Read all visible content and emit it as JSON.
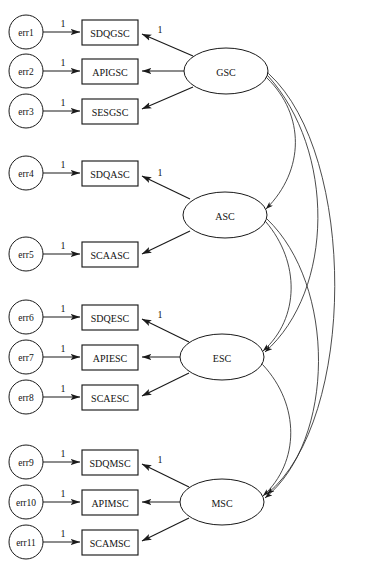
{
  "figure": {
    "type": "sem-path-diagram",
    "title_fragment": "",
    "width": 370,
    "height": 569,
    "background": "#ffffff",
    "stroke_color": "#1a1a1a",
    "arc_color": "#2b2b2b",
    "text_color": "#121212"
  },
  "errors": [
    {
      "id": "err1",
      "label": "err1",
      "cx": 26,
      "cy": 32,
      "r": 17
    },
    {
      "id": "err2",
      "label": "err2",
      "cx": 26,
      "cy": 71,
      "r": 17
    },
    {
      "id": "err3",
      "label": "err3",
      "cx": 26,
      "cy": 111,
      "r": 17
    },
    {
      "id": "err4",
      "label": "err4",
      "cx": 26,
      "cy": 173,
      "r": 17
    },
    {
      "id": "err5",
      "label": "err5",
      "cx": 26,
      "cy": 254,
      "r": 17
    },
    {
      "id": "err6",
      "label": "err6",
      "cx": 26,
      "cy": 317,
      "r": 17
    },
    {
      "id": "err7",
      "label": "err7",
      "cx": 26,
      "cy": 357,
      "r": 17
    },
    {
      "id": "err8",
      "label": "err8",
      "cx": 26,
      "cy": 397,
      "r": 17
    },
    {
      "id": "err9",
      "label": "err9",
      "cx": 26,
      "cy": 462,
      "r": 17
    },
    {
      "id": "err10",
      "label": "err10",
      "cx": 26,
      "cy": 502,
      "r": 17
    },
    {
      "id": "err11",
      "label": "err11",
      "cx": 26,
      "cy": 542,
      "r": 17
    }
  ],
  "observed": [
    {
      "id": "SDQGSC",
      "label": "SDQGSC",
      "x": 82,
      "y": 20,
      "w": 56,
      "h": 25
    },
    {
      "id": "APIGSC",
      "label": "APIGSC",
      "x": 82,
      "y": 59,
      "w": 56,
      "h": 25
    },
    {
      "id": "SESGSC",
      "label": "SESGSC",
      "x": 82,
      "y": 99,
      "w": 56,
      "h": 25
    },
    {
      "id": "SDQASC",
      "label": "SDQASC",
      "x": 82,
      "y": 161,
      "w": 56,
      "h": 25
    },
    {
      "id": "SCAASC",
      "label": "SCAASC",
      "x": 82,
      "y": 242,
      "w": 56,
      "h": 25
    },
    {
      "id": "SDQESC",
      "label": "SDQESC",
      "x": 82,
      "y": 305,
      "w": 56,
      "h": 25
    },
    {
      "id": "APIESC",
      "label": "APIESC",
      "x": 82,
      "y": 345,
      "w": 56,
      "h": 25
    },
    {
      "id": "SCAESC",
      "label": "SCAESC",
      "x": 82,
      "y": 385,
      "w": 56,
      "h": 25
    },
    {
      "id": "SDQMSC",
      "label": "SDQMSC",
      "x": 82,
      "y": 450,
      "w": 56,
      "h": 25
    },
    {
      "id": "APIMSC",
      "label": "APIMSC",
      "x": 82,
      "y": 490,
      "w": 56,
      "h": 25
    },
    {
      "id": "SCAMSC",
      "label": "SCAMSC",
      "x": 82,
      "y": 530,
      "w": 56,
      "h": 25
    }
  ],
  "latents": [
    {
      "id": "GSC",
      "label": "GSC",
      "cx": 226,
      "cy": 71,
      "rx": 42,
      "ry": 23
    },
    {
      "id": "ASC",
      "label": "ASC",
      "cx": 225,
      "cy": 215,
      "rx": 42,
      "ry": 23
    },
    {
      "id": "ESC",
      "label": "ESC",
      "cx": 222,
      "cy": 357,
      "rx": 42,
      "ry": 23
    },
    {
      "id": "MSC",
      "label": "MSC",
      "cx": 222,
      "cy": 502,
      "rx": 42,
      "ry": 23
    }
  ],
  "error_paths": [
    {
      "from": "err1",
      "to": "SDQGSC",
      "weight": "1",
      "label_x": 63,
      "label_y": 23
    },
    {
      "from": "err2",
      "to": "APIGSC",
      "weight": "1",
      "label_x": 63,
      "label_y": 62
    },
    {
      "from": "err3",
      "to": "SESGSC",
      "weight": "1",
      "label_x": 63,
      "label_y": 102
    },
    {
      "from": "err4",
      "to": "SDQASC",
      "weight": "1",
      "label_x": 63,
      "label_y": 164
    },
    {
      "from": "err5",
      "to": "SCAASC",
      "weight": "1",
      "label_x": 63,
      "label_y": 245
    },
    {
      "from": "err6",
      "to": "SDQESC",
      "weight": "1",
      "label_x": 63,
      "label_y": 308
    },
    {
      "from": "err7",
      "to": "APIESC",
      "weight": "1",
      "label_x": 63,
      "label_y": 348
    },
    {
      "from": "err8",
      "to": "SCAESC",
      "weight": "1",
      "label_x": 63,
      "label_y": 388
    },
    {
      "from": "err9",
      "to": "SDQMSC",
      "weight": "1",
      "label_x": 63,
      "label_y": 453
    },
    {
      "from": "err10",
      "to": "APIMSC",
      "weight": "1",
      "label_x": 63,
      "label_y": 493
    },
    {
      "from": "err11",
      "to": "SCAMSC",
      "weight": "1",
      "label_x": 63,
      "label_y": 533
    }
  ],
  "loading_paths": [
    {
      "from": "GSC",
      "to": "SDQGSC",
      "weight": "1",
      "label_x": 160,
      "label_y": 29
    },
    {
      "from": "GSC",
      "to": "APIGSC",
      "weight": "",
      "label_x": 0,
      "label_y": 0
    },
    {
      "from": "GSC",
      "to": "SESGSC",
      "weight": "",
      "label_x": 0,
      "label_y": 0
    },
    {
      "from": "ASC",
      "to": "SDQASC",
      "weight": "1",
      "label_x": 160,
      "label_y": 172
    },
    {
      "from": "ASC",
      "to": "SCAASC",
      "weight": "",
      "label_x": 0,
      "label_y": 0
    },
    {
      "from": "ESC",
      "to": "SDQESC",
      "weight": "1",
      "label_x": 160,
      "label_y": 314
    },
    {
      "from": "ESC",
      "to": "APIESC",
      "weight": "",
      "label_x": 0,
      "label_y": 0
    },
    {
      "from": "ESC",
      "to": "SCAESC",
      "weight": "",
      "label_x": 0,
      "label_y": 0
    },
    {
      "from": "MSC",
      "to": "SDQMSC",
      "weight": "1",
      "label_x": 160,
      "label_y": 459
    },
    {
      "from": "MSC",
      "to": "APIMSC",
      "weight": "",
      "label_x": 0,
      "label_y": 0
    },
    {
      "from": "MSC",
      "to": "SCAMSC",
      "weight": "",
      "label_x": 0,
      "label_y": 0
    }
  ],
  "covariances": [
    {
      "from": "GSC",
      "to": "ASC",
      "weight": ""
    },
    {
      "from": "GSC",
      "to": "ESC",
      "weight": ""
    },
    {
      "from": "GSC",
      "to": "MSC",
      "weight": ""
    },
    {
      "from": "ASC",
      "to": "ESC",
      "weight": ""
    },
    {
      "from": "ASC",
      "to": "MSC",
      "weight": ""
    },
    {
      "from": "ESC",
      "to": "MSC",
      "weight": ""
    }
  ],
  "labels": {
    "err1": "err1",
    "err2": "err2",
    "err3": "err3",
    "err4": "err4",
    "err5": "err5",
    "err6": "err6",
    "err7": "err7",
    "err8": "err8",
    "err9": "err9",
    "err10": "err10",
    "err11": "err11",
    "SDQGSC": "SDQGSC",
    "APIGSC": "APIGSC",
    "SESGSC": "SESGSC",
    "SDQASC": "SDQASC",
    "SCAASC": "SCAASC",
    "SDQESC": "SDQESC",
    "APIESC": "APIESC",
    "SCAESC": "SCAESC",
    "SDQMSC": "SDQMSC",
    "APIMSC": "APIMSC",
    "SCAMSC": "SCAMSC",
    "GSC": "GSC",
    "ASC": "ASC",
    "ESC": "ESC",
    "MSC": "MSC",
    "one": "1"
  }
}
